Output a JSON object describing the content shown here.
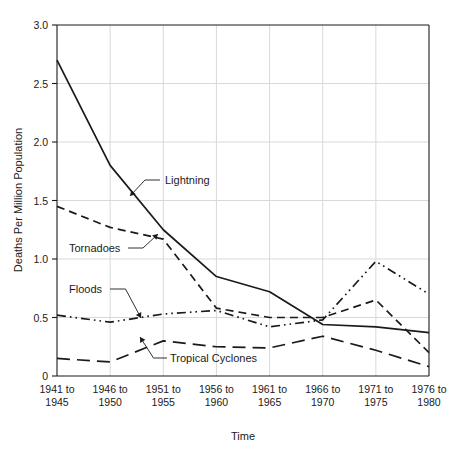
{
  "chart_data": {
    "type": "line",
    "title": "",
    "xlabel": "Time",
    "ylabel": "Deaths Per Million Population",
    "grid": true,
    "legend_position": "inline-annotations",
    "categories": [
      "1941 to 1945",
      "1946 to 1950",
      "1951 to 1955",
      "1956 to 1960",
      "1961 to 1965",
      "1966 to 1970",
      "1971 to 1975",
      "1976 to 1980"
    ],
    "xtick_lines": [
      [
        "1941 to",
        "1945"
      ],
      [
        "1946 to",
        "1950"
      ],
      [
        "1951 to",
        "1955"
      ],
      [
        "1956 to",
        "1960"
      ],
      [
        "1961 to",
        "1965"
      ],
      [
        "1966 to",
        "1970"
      ],
      [
        "1971 to",
        "1975"
      ],
      [
        "1976 to",
        "1980"
      ]
    ],
    "ylim": [
      0,
      3.0
    ],
    "yticks": [
      0,
      0.5,
      1.0,
      1.5,
      2.0,
      2.5,
      3.0
    ],
    "ytick_labels": [
      "0",
      "0.5",
      "1.0",
      "1.5",
      "2.0",
      "2.5",
      "3.0"
    ],
    "series": [
      {
        "name": "Lightning",
        "style": "solid",
        "values": [
          2.7,
          1.8,
          1.25,
          0.85,
          0.72,
          0.44,
          0.42,
          0.37
        ]
      },
      {
        "name": "Tornadoes",
        "style": "dashed",
        "values": [
          1.45,
          1.27,
          1.17,
          0.58,
          0.5,
          0.5,
          0.65,
          0.2
        ]
      },
      {
        "name": "Floods",
        "style": "dash-dot-dot",
        "values": [
          0.52,
          0.46,
          0.53,
          0.56,
          0.42,
          0.48,
          0.98,
          0.7
        ]
      },
      {
        "name": "Tropical Cyclones",
        "style": "long-dash",
        "values": [
          0.15,
          0.12,
          0.3,
          0.25,
          0.24,
          0.34,
          0.22,
          0.08
        ]
      }
    ],
    "annotations": [
      {
        "label": "Lightning",
        "series": "Lightning"
      },
      {
        "label": "Tornadoes",
        "series": "Tornadoes"
      },
      {
        "label": "Floods",
        "series": "Floods"
      },
      {
        "label": "Tropical Cyclones",
        "series": "Tropical Cyclones"
      }
    ],
    "colors": {
      "line": "#1a1a1a",
      "grid": "#d9d9d9",
      "background": "#ffffff"
    }
  }
}
